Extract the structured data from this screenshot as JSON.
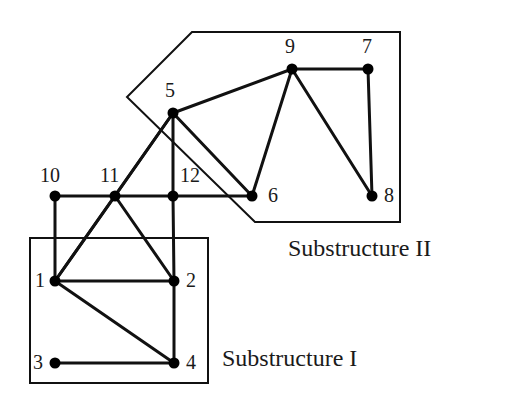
{
  "figure": {
    "background_color": "#ffffff",
    "stroke_color": "#111111",
    "node_fill_color": "#000000",
    "width": 521,
    "height": 418
  },
  "captions": [
    {
      "id": "substructure-2",
      "text": "Substructure II",
      "x": 288,
      "y": 236
    },
    {
      "id": "substructure-1",
      "text": "Substructure I",
      "x": 222,
      "y": 346
    }
  ],
  "nodes": [
    {
      "id": "1",
      "label": "1",
      "x": 55,
      "y": 281,
      "label_x": 35,
      "label_y": 270
    },
    {
      "id": "2",
      "label": "2",
      "x": 174,
      "y": 281,
      "label_x": 186,
      "label_y": 270
    },
    {
      "id": "3",
      "label": "3",
      "x": 55,
      "y": 363,
      "label_x": 33,
      "label_y": 352
    },
    {
      "id": "4",
      "label": "4",
      "x": 174,
      "y": 363,
      "label_x": 186,
      "label_y": 352
    },
    {
      "id": "5",
      "label": "5",
      "x": 173,
      "y": 113,
      "label_x": 165,
      "label_y": 80
    },
    {
      "id": "6",
      "label": "6",
      "x": 252,
      "y": 196,
      "label_x": 268,
      "label_y": 185
    },
    {
      "id": "7",
      "label": "7",
      "x": 368,
      "y": 69,
      "label_x": 362,
      "label_y": 36
    },
    {
      "id": "8",
      "label": "8",
      "x": 372,
      "y": 196,
      "label_x": 384,
      "label_y": 185
    },
    {
      "id": "9",
      "label": "9",
      "x": 292,
      "y": 69,
      "label_x": 285,
      "label_y": 36
    },
    {
      "id": "10",
      "label": "10",
      "x": 55,
      "y": 196,
      "label_x": 40,
      "label_y": 165
    },
    {
      "id": "11",
      "label": "11",
      "x": 115,
      "y": 196,
      "label_x": 100,
      "label_y": 165
    },
    {
      "id": "12",
      "label": "12",
      "x": 173,
      "y": 196,
      "label_x": 180,
      "label_y": 165
    }
  ],
  "edges": [
    {
      "from": "10",
      "to": "11"
    },
    {
      "from": "11",
      "to": "12"
    },
    {
      "from": "12",
      "to": "6"
    },
    {
      "from": "10",
      "to": "1"
    },
    {
      "from": "12",
      "to": "2"
    },
    {
      "from": "1",
      "to": "2"
    },
    {
      "from": "1",
      "to": "11"
    },
    {
      "from": "1",
      "to": "5"
    },
    {
      "from": "1",
      "to": "4"
    },
    {
      "from": "3",
      "to": "4"
    },
    {
      "from": "2",
      "to": "4"
    },
    {
      "from": "11",
      "to": "2"
    },
    {
      "from": "11",
      "to": "5"
    },
    {
      "from": "5",
      "to": "12"
    },
    {
      "from": "5",
      "to": "6"
    },
    {
      "from": "5",
      "to": "9"
    },
    {
      "from": "9",
      "to": "7"
    },
    {
      "from": "9",
      "to": "6"
    },
    {
      "from": "9",
      "to": "8"
    },
    {
      "from": "7",
      "to": "8"
    }
  ],
  "regions": [
    {
      "id": "substructure-1-box",
      "name": "substructure-one-outline",
      "shape": "rect",
      "points": "30,238 208,238 208,383 30,383"
    },
    {
      "id": "substructure-2-polygon",
      "name": "substructure-two-outline",
      "shape": "polygon",
      "points": "192,32 400,32 400,222 255,222 127,97"
    }
  ],
  "style": {
    "edge_width": 3,
    "region_width": 2,
    "node_radius": 5.5
  }
}
